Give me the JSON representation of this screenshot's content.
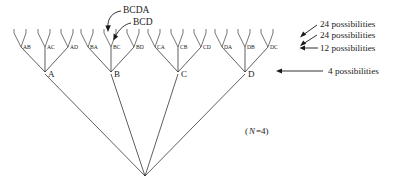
{
  "figure": {
    "title_note": "(N=4)",
    "n_label_italic": "N",
    "n_label_rest": "=4)",
    "n_label_open": "(",
    "stroke_color": "#1a1a1a",
    "background_color": "#ffffff"
  },
  "tree": {
    "root_labels": [
      "A",
      "B",
      "C",
      "D"
    ],
    "groups": [
      {
        "root": "A",
        "pairs": [
          "AB",
          "AC",
          "AD"
        ]
      },
      {
        "root": "B",
        "pairs": [
          "BA",
          "BC",
          "BD"
        ]
      },
      {
        "root": "C",
        "pairs": [
          "CA",
          "CB",
          "CD"
        ]
      },
      {
        "root": "D",
        "pairs": [
          "DA",
          "DB",
          "DC"
        ]
      }
    ]
  },
  "annotations": [
    {
      "name": "bcda",
      "label": "BCDA"
    },
    {
      "name": "bcd",
      "label": "BCD"
    }
  ],
  "legend": [
    {
      "label": "24 possibilities",
      "arrow": "diagonal"
    },
    {
      "label": "24 possibilities",
      "arrow": "diagonal"
    },
    {
      "label": "12 possibilities",
      "arrow": "horizontal-short"
    },
    {
      "label": "4 possibilities",
      "arrow": "horizontal-long"
    }
  ]
}
